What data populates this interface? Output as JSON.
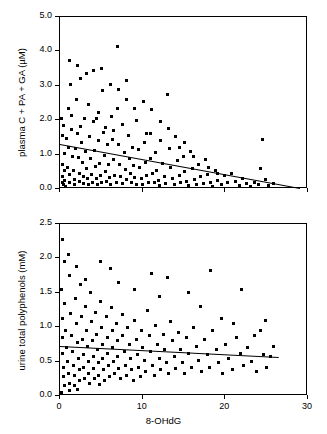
{
  "chart_data": [
    {
      "type": "scatter",
      "id": "panel-top",
      "title": "",
      "xlabel": "",
      "ylabel": "plasma C + PA + GA (µM)",
      "xlim": [
        0,
        30
      ],
      "ylim": [
        0,
        5.0
      ],
      "xticks": [
        0,
        10,
        20,
        30
      ],
      "xticklabels": [
        "",
        "",
        "",
        ""
      ],
      "yticks": [
        0.0,
        1.0,
        2.0,
        3.0,
        4.0,
        5.0
      ],
      "yticklabels": [
        "0.0",
        "1.0",
        "2.0",
        "3.0",
        "4.0",
        "5.0"
      ],
      "grid": false,
      "legend": null,
      "fit_line": {
        "x0": 0.0,
        "y0": 1.3,
        "x1": 29.0,
        "y1": 0.02
      },
      "points": [
        [
          0.2,
          2.05
        ],
        [
          0.25,
          1.55
        ],
        [
          0.3,
          0.72
        ],
        [
          0.3,
          0.35
        ],
        [
          0.35,
          0.18
        ],
        [
          0.4,
          0.12
        ],
        [
          0.5,
          1.02
        ],
        [
          0.55,
          0.55
        ],
        [
          0.6,
          0.25
        ],
        [
          0.7,
          0.08
        ],
        [
          0.8,
          1.48
        ],
        [
          0.9,
          0.62
        ],
        [
          1.0,
          2.35
        ],
        [
          1.05,
          1.22
        ],
        [
          1.1,
          0.42
        ],
        [
          1.2,
          0.2
        ],
        [
          1.3,
          3.05
        ],
        [
          1.4,
          1.72
        ],
        [
          1.5,
          0.95
        ],
        [
          1.6,
          0.55
        ],
        [
          1.7,
          0.28
        ],
        [
          1.8,
          0.14
        ],
        [
          1.9,
          1.18
        ],
        [
          2.0,
          2.6
        ],
        [
          2.1,
          1.62
        ],
        [
          2.2,
          0.92
        ],
        [
          2.3,
          0.45
        ],
        [
          2.4,
          0.22
        ],
        [
          2.5,
          3.2
        ],
        [
          2.6,
          1.35
        ],
        [
          2.7,
          0.78
        ],
        [
          2.8,
          0.35
        ],
        [
          2.9,
          0.15
        ],
        [
          3.0,
          2.05
        ],
        [
          3.1,
          1.08
        ],
        [
          3.2,
          0.6
        ],
        [
          3.3,
          0.3
        ],
        [
          3.4,
          0.12
        ],
        [
          3.5,
          2.45
        ],
        [
          3.6,
          1.52
        ],
        [
          3.7,
          0.88
        ],
        [
          3.8,
          0.42
        ],
        [
          3.9,
          0.2
        ],
        [
          4.0,
          3.45
        ],
        [
          4.1,
          1.95
        ],
        [
          4.2,
          1.12
        ],
        [
          4.3,
          0.65
        ],
        [
          4.4,
          0.3
        ],
        [
          4.5,
          0.12
        ],
        [
          4.6,
          2.22
        ],
        [
          4.7,
          1.4
        ],
        [
          4.8,
          0.75
        ],
        [
          4.9,
          0.38
        ],
        [
          5.0,
          0.18
        ],
        [
          5.2,
          2.85
        ],
        [
          5.3,
          1.65
        ],
        [
          5.4,
          0.98
        ],
        [
          5.5,
          0.5
        ],
        [
          5.6,
          0.22
        ],
        [
          5.8,
          1.28
        ],
        [
          5.9,
          0.7
        ],
        [
          6.0,
          0.32
        ],
        [
          6.1,
          0.14
        ],
        [
          6.2,
          2.1
        ],
        [
          6.4,
          1.45
        ],
        [
          6.5,
          0.85
        ],
        [
          6.6,
          0.4
        ],
        [
          6.8,
          0.18
        ],
        [
          6.9,
          4.15
        ],
        [
          7.0,
          2.35
        ],
        [
          7.1,
          1.3
        ],
        [
          7.2,
          0.72
        ],
        [
          7.3,
          0.35
        ],
        [
          7.5,
          0.15
        ],
        [
          7.6,
          1.88
        ],
        [
          7.8,
          1.05
        ],
        [
          7.9,
          0.58
        ],
        [
          8.0,
          0.28
        ],
        [
          8.1,
          3.15
        ],
        [
          8.3,
          1.55
        ],
        [
          8.4,
          0.9
        ],
        [
          8.5,
          0.45
        ],
        [
          8.6,
          0.2
        ],
        [
          8.8,
          1.22
        ],
        [
          8.9,
          0.68
        ],
        [
          9.0,
          0.32
        ],
        [
          9.2,
          0.14
        ],
        [
          9.3,
          2.0
        ],
        [
          9.5,
          1.15
        ],
        [
          9.6,
          0.62
        ],
        [
          9.8,
          0.3
        ],
        [
          10.0,
          0.12
        ],
        [
          10.1,
          2.55
        ],
        [
          10.2,
          1.35
        ],
        [
          10.4,
          0.78
        ],
        [
          10.5,
          0.38
        ],
        [
          10.7,
          0.18
        ],
        [
          10.9,
          1.6
        ],
        [
          11.0,
          0.88
        ],
        [
          11.2,
          0.45
        ],
        [
          11.4,
          0.2
        ],
        [
          11.5,
          1.05
        ],
        [
          11.7,
          0.55
        ],
        [
          11.9,
          0.25
        ],
        [
          12.0,
          0.1
        ],
        [
          12.2,
          1.4
        ],
        [
          12.4,
          0.75
        ],
        [
          12.6,
          0.35
        ],
        [
          12.8,
          0.15
        ],
        [
          13.0,
          2.75
        ],
        [
          13.2,
          1.18
        ],
        [
          13.4,
          0.62
        ],
        [
          13.6,
          0.3
        ],
        [
          13.8,
          0.12
        ],
        [
          14.0,
          1.52
        ],
        [
          14.2,
          0.82
        ],
        [
          14.4,
          0.4
        ],
        [
          14.6,
          0.18
        ],
        [
          14.9,
          0.95
        ],
        [
          15.1,
          0.5
        ],
        [
          15.3,
          0.22
        ],
        [
          15.5,
          0.1
        ],
        [
          15.8,
          1.1
        ],
        [
          16.0,
          0.6
        ],
        [
          16.3,
          0.28
        ],
        [
          16.5,
          0.12
        ],
        [
          16.8,
          0.72
        ],
        [
          17.0,
          0.35
        ],
        [
          17.3,
          0.15
        ],
        [
          17.6,
          0.85
        ],
        [
          17.9,
          0.42
        ],
        [
          18.2,
          0.2
        ],
        [
          18.5,
          0.08
        ],
        [
          18.8,
          0.55
        ],
        [
          19.1,
          0.25
        ],
        [
          19.5,
          0.12
        ],
        [
          19.9,
          0.38
        ],
        [
          20.3,
          0.18
        ],
        [
          20.8,
          0.45
        ],
        [
          21.2,
          0.22
        ],
        [
          21.7,
          0.1
        ],
        [
          22.1,
          0.3
        ],
        [
          22.6,
          0.15
        ],
        [
          23.0,
          0.08
        ],
        [
          23.5,
          0.2
        ],
        [
          24.0,
          0.12
        ],
        [
          24.5,
          1.45
        ],
        [
          24.8,
          0.28
        ],
        [
          25.2,
          0.1
        ],
        [
          25.8,
          0.15
        ],
        [
          1.15,
          3.75
        ],
        [
          2.15,
          3.6
        ],
        [
          3.15,
          3.35
        ],
        [
          5.05,
          3.5
        ],
        [
          6.15,
          3.05
        ],
        [
          7.05,
          2.9
        ],
        [
          8.05,
          2.6
        ],
        [
          9.05,
          2.35
        ],
        [
          11.1,
          2.3
        ],
        [
          12.1,
          1.95
        ],
        [
          13.1,
          1.75
        ],
        [
          0.45,
          1.85
        ],
        [
          1.45,
          2.15
        ],
        [
          2.45,
          1.82
        ],
        [
          4.45,
          2.05
        ],
        [
          5.45,
          1.78
        ],
        [
          6.45,
          1.7
        ],
        [
          10.45,
          1.62
        ],
        [
          14.5,
          1.2
        ],
        [
          15.0,
          1.35
        ],
        [
          16.1,
          0.95
        ],
        [
          18.0,
          0.62
        ],
        [
          19.0,
          0.45
        ],
        [
          24.2,
          0.6
        ]
      ]
    },
    {
      "type": "scatter",
      "id": "panel-bottom",
      "title": "",
      "xlabel": "8-OHdG",
      "ylabel": "urine total polyphenols (mM)",
      "xlim": [
        0,
        30
      ],
      "ylim": [
        0,
        2.5
      ],
      "xticks": [
        0,
        10,
        20,
        30
      ],
      "xticklabels": [
        "0",
        "10",
        "20",
        "30"
      ],
      "yticks": [
        0.0,
        0.5,
        1.0,
        1.5,
        2.0,
        2.5
      ],
      "yticklabels": [
        "0.0",
        "0.5",
        "1.0",
        "1.5",
        "2.0",
        "2.5"
      ],
      "grid": false,
      "legend": null,
      "fit_line": {
        "x0": 0.0,
        "y0": 0.72,
        "x1": 26.5,
        "y1": 0.56
      },
      "points": [
        [
          0.2,
          1.55
        ],
        [
          0.25,
          1.12
        ],
        [
          0.3,
          0.85
        ],
        [
          0.35,
          0.62
        ],
        [
          0.4,
          0.42
        ],
        [
          0.45,
          0.28
        ],
        [
          0.5,
          0.15
        ],
        [
          0.6,
          1.35
        ],
        [
          0.7,
          0.95
        ],
        [
          0.8,
          0.7
        ],
        [
          0.9,
          0.5
        ],
        [
          1.0,
          0.32
        ],
        [
          1.1,
          0.18
        ],
        [
          1.2,
          1.75
        ],
        [
          1.3,
          1.2
        ],
        [
          1.4,
          0.88
        ],
        [
          1.5,
          0.65
        ],
        [
          1.6,
          0.45
        ],
        [
          1.7,
          0.3
        ],
        [
          1.8,
          0.15
        ],
        [
          1.9,
          1.42
        ],
        [
          2.0,
          1.05
        ],
        [
          2.1,
          0.78
        ],
        [
          2.2,
          0.55
        ],
        [
          2.3,
          0.38
        ],
        [
          2.4,
          0.22
        ],
        [
          2.5,
          1.62
        ],
        [
          2.6,
          1.15
        ],
        [
          2.7,
          0.82
        ],
        [
          2.8,
          0.6
        ],
        [
          2.9,
          0.42
        ],
        [
          3.0,
          0.25
        ],
        [
          3.1,
          1.3
        ],
        [
          3.2,
          0.95
        ],
        [
          3.3,
          0.72
        ],
        [
          3.4,
          0.5
        ],
        [
          3.5,
          0.32
        ],
        [
          3.6,
          0.18
        ],
        [
          3.7,
          1.5
        ],
        [
          3.8,
          1.08
        ],
        [
          3.9,
          0.8
        ],
        [
          4.0,
          0.58
        ],
        [
          4.1,
          0.4
        ],
        [
          4.2,
          0.25
        ],
        [
          4.3,
          1.22
        ],
        [
          4.4,
          0.9
        ],
        [
          4.5,
          0.68
        ],
        [
          4.6,
          0.48
        ],
        [
          4.7,
          0.3
        ],
        [
          4.8,
          0.16
        ],
        [
          4.9,
          1.38
        ],
        [
          5.0,
          1.0
        ],
        [
          5.1,
          0.75
        ],
        [
          5.2,
          0.55
        ],
        [
          5.3,
          0.38
        ],
        [
          5.4,
          0.22
        ],
        [
          5.6,
          1.15
        ],
        [
          5.7,
          0.85
        ],
        [
          5.8,
          0.62
        ],
        [
          5.9,
          0.45
        ],
        [
          6.0,
          0.28
        ],
        [
          6.2,
          1.28
        ],
        [
          6.3,
          0.95
        ],
        [
          6.4,
          0.7
        ],
        [
          6.5,
          0.5
        ],
        [
          6.6,
          0.32
        ],
        [
          6.8,
          1.05
        ],
        [
          6.9,
          0.8
        ],
        [
          7.0,
          0.58
        ],
        [
          7.1,
          0.4
        ],
        [
          7.3,
          0.25
        ],
        [
          7.5,
          1.18
        ],
        [
          7.6,
          0.88
        ],
        [
          7.8,
          0.65
        ],
        [
          7.9,
          0.45
        ],
        [
          8.0,
          0.3
        ],
        [
          8.2,
          1.0
        ],
        [
          8.4,
          0.75
        ],
        [
          8.5,
          0.55
        ],
        [
          8.7,
          0.38
        ],
        [
          8.9,
          0.22
        ],
        [
          9.0,
          1.1
        ],
        [
          9.2,
          0.82
        ],
        [
          9.4,
          0.6
        ],
        [
          9.5,
          0.42
        ],
        [
          9.7,
          0.28
        ],
        [
          9.9,
          0.95
        ],
        [
          10.0,
          0.7
        ],
        [
          10.2,
          0.52
        ],
        [
          10.4,
          0.35
        ],
        [
          10.6,
          1.25
        ],
        [
          10.8,
          0.88
        ],
        [
          11.0,
          0.65
        ],
        [
          11.2,
          0.45
        ],
        [
          11.4,
          0.3
        ],
        [
          11.6,
          1.02
        ],
        [
          11.8,
          0.75
        ],
        [
          12.0,
          0.55
        ],
        [
          12.2,
          0.38
        ],
        [
          12.5,
          0.9
        ],
        [
          12.7,
          0.68
        ],
        [
          12.9,
          0.48
        ],
        [
          13.1,
          0.32
        ],
        [
          13.4,
          1.08
        ],
        [
          13.6,
          0.8
        ],
        [
          13.8,
          0.58
        ],
        [
          14.0,
          0.4
        ],
        [
          14.3,
          0.92
        ],
        [
          14.6,
          0.68
        ],
        [
          14.8,
          0.48
        ],
        [
          15.0,
          0.32
        ],
        [
          15.3,
          0.85
        ],
        [
          15.6,
          0.62
        ],
        [
          15.9,
          0.42
        ],
        [
          16.2,
          1.0
        ],
        [
          16.5,
          0.72
        ],
        [
          16.8,
          0.52
        ],
        [
          17.1,
          0.35
        ],
        [
          17.5,
          0.82
        ],
        [
          17.8,
          0.6
        ],
        [
          18.1,
          0.42
        ],
        [
          18.5,
          0.95
        ],
        [
          18.9,
          0.68
        ],
        [
          19.2,
          0.48
        ],
        [
          19.6,
          0.32
        ],
        [
          20.0,
          0.75
        ],
        [
          20.4,
          0.55
        ],
        [
          20.9,
          0.38
        ],
        [
          21.3,
          0.85
        ],
        [
          21.8,
          0.62
        ],
        [
          22.2,
          0.45
        ],
        [
          22.7,
          0.7
        ],
        [
          23.2,
          0.5
        ],
        [
          23.8,
          0.35
        ],
        [
          24.2,
          0.95
        ],
        [
          24.6,
          0.6
        ],
        [
          25.0,
          0.42
        ],
        [
          25.5,
          0.58
        ],
        [
          0.28,
          2.28
        ],
        [
          1.05,
          2.05
        ],
        [
          4.95,
          1.95
        ],
        [
          6.05,
          1.85
        ],
        [
          2.05,
          1.88
        ],
        [
          11.05,
          1.78
        ],
        [
          18.2,
          1.82
        ],
        [
          13.0,
          1.72
        ],
        [
          15.5,
          1.5
        ],
        [
          22.0,
          1.55
        ],
        [
          7.05,
          1.65
        ],
        [
          9.05,
          1.55
        ],
        [
          0.55,
          1.95
        ],
        [
          3.05,
          1.7
        ],
        [
          12.05,
          1.45
        ],
        [
          17.0,
          1.3
        ],
        [
          19.5,
          1.12
        ],
        [
          21.0,
          1.05
        ],
        [
          23.5,
          0.88
        ],
        [
          24.8,
          1.1
        ],
        [
          25.8,
          0.72
        ],
        [
          0.15,
          0.05
        ],
        [
          1.15,
          0.08
        ],
        [
          2.15,
          0.1
        ]
      ]
    }
  ],
  "labels": {
    "top_ylabel": "plasma C + PA + GA (µM)",
    "bottom_ylabel": "urine total polyphenols (mM)",
    "xlabel": "8-OHdG"
  }
}
